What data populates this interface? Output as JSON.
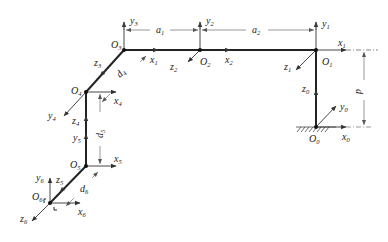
{
  "diagram": {
    "type": "robot-kinematic-frames",
    "colors": {
      "link": "#222222",
      "axis": "#333333",
      "dim": "#555555",
      "ground_hatch": "#444444"
    },
    "origins": [
      {
        "id": "O0",
        "base": "O",
        "sub": "0",
        "x": 316,
        "y": 127
      },
      {
        "id": "O1",
        "base": "O",
        "sub": "1",
        "x": 316,
        "y": 50
      },
      {
        "id": "O2",
        "base": "O",
        "sub": "2",
        "x": 200,
        "y": 50
      },
      {
        "id": "O3",
        "base": "O",
        "sub": "3",
        "x": 124,
        "y": 50
      },
      {
        "id": "O4",
        "base": "O",
        "sub": "4",
        "x": 86,
        "y": 92
      },
      {
        "id": "O5",
        "base": "O",
        "sub": "5",
        "x": 86,
        "y": 166
      },
      {
        "id": "O6",
        "base": "O",
        "sub": "6",
        "x": 50,
        "y": 203
      }
    ],
    "labels": {
      "O0": {
        "b": "O",
        "s": "0"
      },
      "O1": {
        "b": "O",
        "s": "1"
      },
      "O2": {
        "b": "O",
        "s": "2"
      },
      "O3": {
        "b": "O",
        "s": "3"
      },
      "O4": {
        "b": "O",
        "s": "4"
      },
      "O5": {
        "b": "O",
        "s": "5"
      },
      "O6": {
        "b": "O",
        "s": "6"
      },
      "x0": {
        "b": "x",
        "s": "0"
      },
      "y0": {
        "b": "y",
        "s": "0"
      },
      "z0": {
        "b": "z",
        "s": "0"
      },
      "x1": {
        "b": "x",
        "s": "1"
      },
      "y1": {
        "b": "y",
        "s": "1"
      },
      "z1": {
        "b": "z",
        "s": "1"
      },
      "x2": {
        "b": "x",
        "s": "2"
      },
      "y2": {
        "b": "y",
        "s": "2"
      },
      "z2": {
        "b": "z",
        "s": "2"
      },
      "x3": {
        "b": "x",
        "s": "1"
      },
      "y3": {
        "b": "y",
        "s": "3"
      },
      "z3": {
        "b": "z",
        "s": "3"
      },
      "x4": {
        "b": "x",
        "s": "4"
      },
      "y4": {
        "b": "y",
        "s": "4"
      },
      "z4": {
        "b": "z",
        "s": "4"
      },
      "x5": {
        "b": "x",
        "s": "5"
      },
      "y5": {
        "b": "y",
        "s": "5"
      },
      "z5": {
        "b": "z",
        "s": "5"
      },
      "x6": {
        "b": "x",
        "s": "6"
      },
      "y6": {
        "b": "y",
        "s": "6"
      },
      "z6": {
        "b": "z",
        "s": "6"
      }
    },
    "dimensions": {
      "a1": {
        "b": "a",
        "s": "1"
      },
      "a2": {
        "b": "a",
        "s": "2"
      },
      "d4": {
        "b": "d",
        "s": "4"
      },
      "d5": {
        "b": "d",
        "s": "5"
      },
      "d6": {
        "b": "d",
        "s": "6"
      },
      "p": {
        "b": "p",
        "s": ""
      }
    }
  }
}
